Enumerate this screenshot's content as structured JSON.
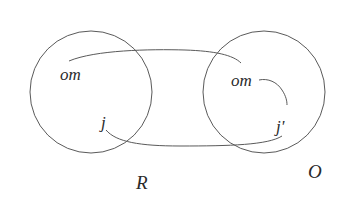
{
  "diagram": {
    "type": "set-mapping",
    "sets": [
      {
        "id": "R",
        "label": "R",
        "elements": [
          "om",
          "j"
        ]
      },
      {
        "id": "O",
        "label": "O",
        "elements": [
          "om",
          "j'"
        ]
      }
    ],
    "labels": {
      "left_om": "om",
      "left_j": "j",
      "right_om": "om",
      "right_j": "j'",
      "set_r": "R",
      "set_o": "O"
    },
    "connections": [
      {
        "from": "R.om",
        "to": "O.om"
      },
      {
        "from": "R.j",
        "to": "O.j'"
      },
      {
        "from": "O.om",
        "to": "O.j'"
      }
    ],
    "stroke_color": "#5a5a5a",
    "text_color": "#2a2a2a"
  }
}
